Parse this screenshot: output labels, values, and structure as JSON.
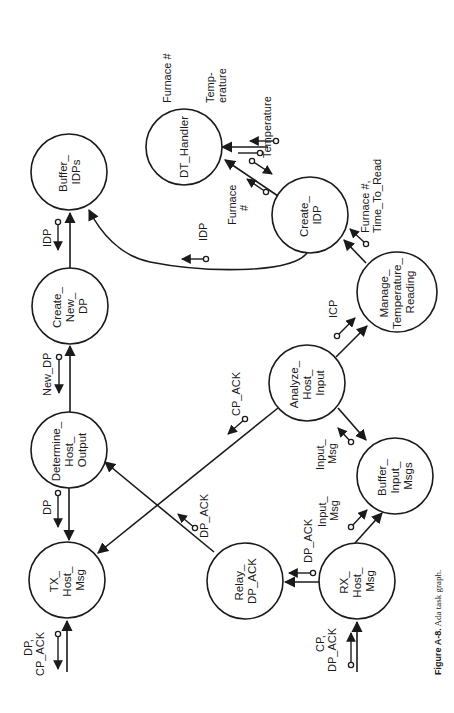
{
  "figure": {
    "caption_label": "Figure A-8.",
    "caption_text": " Ada task graph.",
    "orientation": "rotated 90 degrees counter-clockwise"
  },
  "nodes": {
    "buffer_idps": [
      "Buffer_",
      "IDPs"
    ],
    "dt_handler": [
      "DT_Handler"
    ],
    "create_idp": [
      "Create_",
      "IDP"
    ],
    "manage_temperature_reading": [
      "Manage_",
      "Temperature_",
      "Reading"
    ],
    "create_new_dp": [
      "Create_",
      "New_",
      "DP"
    ],
    "analyze_host_input": [
      "Analyze_",
      "Host_",
      "Input"
    ],
    "determine_host_output": [
      "Determine_",
      "Host_",
      "Output"
    ],
    "buffer_input_msgs": [
      "Buffer_",
      "Input_",
      "Msgs"
    ],
    "tx_host_msg": [
      "TX_",
      "Host_",
      "Msg"
    ],
    "relay_dp_ack": [
      "Relay_",
      "DP_ACK"
    ],
    "rx_host_msg": [
      "RX_",
      "Host_",
      "Msg"
    ]
  },
  "labels": {
    "furnace_no_external": "Furnace #",
    "temperature_external": [
      "Temp-",
      "erature"
    ],
    "temperature_dt": "Temperature",
    "furnace_dt": [
      "Furnace",
      "#"
    ],
    "furnace_time_to_read": [
      "Furnace #,",
      "Time_To_Read"
    ],
    "idp_to_buffer": "IDP",
    "idp_curve": "IDP",
    "icp": "ICP",
    "new_dp": "New_DP",
    "cp_ack": "CP_ACK",
    "dp_to_tx": "DP",
    "dp_ack_relay": "DP_ACK",
    "dp_ack_rx": "DP_ACK",
    "input_msg_analyze": [
      "Input_",
      "Msg"
    ],
    "input_msg_rx": [
      "Input_",
      "Msg"
    ],
    "tx_external": [
      "DP,",
      "CP_ACK"
    ],
    "rx_external": [
      "CP,",
      "DP_ACK"
    ]
  },
  "edges": [
    {
      "from": "Create_New_DP",
      "to": "Buffer_IDPs",
      "data": "IDP"
    },
    {
      "from": "Create_IDP",
      "to": "Buffer_IDPs",
      "data": "IDP"
    },
    {
      "from": "Create_IDP",
      "to": "DT_Handler",
      "data": "Furnace # / Temperature"
    },
    {
      "from": "Manage_Temperature_Reading",
      "to": "Create_IDP",
      "data": "Furnace #, Time_To_Read"
    },
    {
      "from": "Analyze_Host_Input",
      "to": "Manage_Temperature_Reading",
      "data": "ICP"
    },
    {
      "from": "Analyze_Host_Input",
      "to": "Buffer_Input_Msgs",
      "data": "Input_Msg"
    },
    {
      "from": "Analyze_Host_Input",
      "to": "TX_Host_Msg",
      "data": "CP_ACK"
    },
    {
      "from": "Determine_Host_Output",
      "to": "Create_New_DP",
      "data": "New_DP"
    },
    {
      "from": "Determine_Host_Output",
      "to": "TX_Host_Msg",
      "data": "DP"
    },
    {
      "from": "Relay_DP_ACK",
      "to": "Determine_Host_Output",
      "data": "DP_ACK"
    },
    {
      "from": "RX_Host_Msg",
      "to": "Relay_DP_ACK",
      "data": "DP_ACK"
    },
    {
      "from": "RX_Host_Msg",
      "to": "Buffer_Input_Msgs",
      "data": "Input_Msg"
    },
    {
      "from": "external",
      "to": "RX_Host_Msg",
      "data": "CP, DP_ACK"
    },
    {
      "from": "TX_Host_Msg",
      "to": "external",
      "data": "DP, CP_ACK"
    },
    {
      "from": "DT_Handler",
      "to": "external",
      "data": "Furnace # / Temperature"
    }
  ]
}
